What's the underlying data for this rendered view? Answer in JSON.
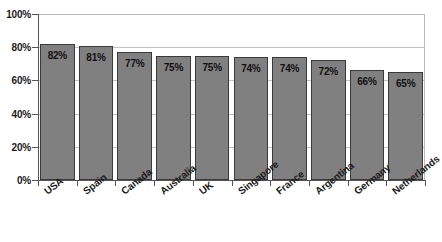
{
  "chart_data": {
    "type": "bar",
    "title": "",
    "subtitle": "",
    "xlabel": "",
    "ylabel": "",
    "categories": [
      "USA",
      "Spain",
      "Canada",
      "Australia",
      "UK",
      "Singapore",
      "France",
      "Argentina",
      "Germany",
      "Netherlands"
    ],
    "values": [
      82,
      81,
      77,
      75,
      75,
      74,
      74,
      72,
      66,
      65
    ],
    "data_labels": [
      "82%",
      "81%",
      "77%",
      "75%",
      "75%",
      "74%",
      "74%",
      "72%",
      "66%",
      "65%"
    ],
    "ylim": [
      0,
      100
    ],
    "ytick_values": [
      0,
      20,
      40,
      60,
      80,
      100
    ],
    "ytick_labels": [
      "0%",
      "20%",
      "40%",
      "60%",
      "80%",
      "100%"
    ],
    "grid": true,
    "legend": "none",
    "series": [
      {
        "name": "",
        "values": [
          82,
          81,
          77,
          75,
          75,
          74,
          74,
          72,
          66,
          65
        ]
      }
    ],
    "colors": {
      "bar_fill": "#808080",
      "bar_border": "#3a3a3a",
      "gridline": "#c4c4c4",
      "axis": "#555555",
      "text": "#1a1a1a",
      "background": "#ffffff"
    }
  }
}
